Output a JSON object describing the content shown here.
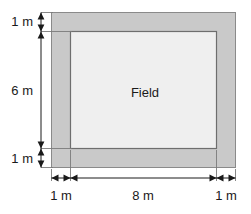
{
  "figure": {
    "type": "geometry-diagram",
    "shapes": {
      "outer_rect": {
        "name": "path-outer-boundary",
        "fill": "#c9c9c9",
        "stroke": "#8a8a8a"
      },
      "inner_rect": {
        "name": "field-area",
        "label": "Field",
        "fill": "#efefef",
        "stroke": "#6e6e6e"
      }
    },
    "labels": {
      "field": "Field"
    },
    "dimensions": {
      "vertical": [
        {
          "id": "top-border",
          "value": "1 m"
        },
        {
          "id": "field-height",
          "value": "6 m"
        },
        {
          "id": "bottom-border",
          "value": "1 m"
        }
      ],
      "horizontal": [
        {
          "id": "left-border",
          "value": "1 m"
        },
        {
          "id": "field-width",
          "value": "8 m"
        },
        {
          "id": "right-border",
          "value": "1 m"
        }
      ]
    },
    "colors": {
      "page_background": "#ffffff",
      "path_fill": "#c9c9c9",
      "field_fill": "#efefef",
      "outer_stroke": "#8a8a8a",
      "inner_stroke": "#6e6e6e",
      "dimension_line": "#1a1a1a",
      "text": "#1a1a1a"
    }
  }
}
